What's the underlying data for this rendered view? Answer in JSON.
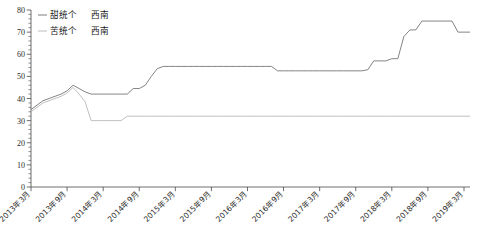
{
  "chart_data": {
    "type": "line",
    "title": "",
    "subtitle": "",
    "xlabel": "",
    "ylabel": "",
    "ylim": [
      0,
      80
    ],
    "ytick_step": 10,
    "yticks": [
      "0",
      "10",
      "20",
      "30",
      "40",
      "50",
      "60",
      "70",
      "80"
    ],
    "minor_tick_step": 2,
    "grid": false,
    "legend_position": "top-left",
    "x_tick_labels": [
      "2013年3月",
      "2013年9月",
      "2014年3月",
      "2014年9月",
      "2015年3月",
      "2015年9月",
      "2016年3月",
      "2016年9月",
      "2017年3月",
      "2017年9月",
      "2018年3月",
      "2018年9月",
      "2019年3月"
    ],
    "x_tick_months": [
      0,
      6,
      12,
      18,
      24,
      30,
      36,
      42,
      48,
      54,
      60,
      66,
      72
    ],
    "x_range_months": [
      0,
      73
    ],
    "series": [
      {
        "name": "甜统个　西南",
        "legend_label": "甜统个",
        "legend_region": "西南",
        "color": "#6e6e6e",
        "values": [
          35.0,
          37.0,
          39.0,
          40.0,
          41.0,
          42.0,
          43.5,
          46.0,
          44.5,
          43.0,
          42.0,
          42.0,
          42.0,
          42.0,
          42.0,
          42.0,
          42.0,
          44.5,
          44.5,
          46.0,
          50.0,
          53.5,
          54.5,
          54.5,
          54.5,
          54.5,
          54.5,
          54.5,
          54.5,
          54.5,
          54.5,
          54.5,
          54.5,
          54.5,
          54.5,
          54.5,
          54.5,
          54.5,
          54.5,
          54.5,
          54.5,
          52.5,
          52.5,
          52.5,
          52.5,
          52.5,
          52.5,
          52.5,
          52.5,
          52.5,
          52.5,
          52.5,
          52.5,
          52.5,
          52.5,
          52.5,
          53.0,
          57.0,
          57.0,
          57.0,
          58.0,
          58.0,
          68.0,
          71.0,
          71.0,
          75.0,
          75.0,
          75.0,
          75.0,
          75.0,
          75.0,
          70.0,
          70.0,
          70.0
        ]
      },
      {
        "name": "苦统个　西南",
        "legend_label": "苦统个",
        "legend_region": "西南",
        "color": "#b4b4b4",
        "values": [
          34.0,
          36.0,
          38.0,
          39.0,
          40.0,
          41.0,
          42.5,
          45.0,
          42.0,
          38.5,
          30.0,
          30.0,
          30.0,
          30.0,
          30.0,
          30.0,
          32.0,
          32.0,
          32.0,
          32.0,
          32.0,
          32.0,
          32.0,
          32.0,
          32.0,
          32.0,
          32.0,
          32.0,
          32.0,
          32.0,
          32.0,
          32.0,
          32.0,
          32.0,
          32.0,
          32.0,
          32.0,
          32.0,
          32.0,
          32.0,
          32.0,
          32.0,
          32.0,
          32.0,
          32.0,
          32.0,
          32.0,
          32.0,
          32.0,
          32.0,
          32.0,
          32.0,
          32.0,
          32.0,
          32.0,
          32.0,
          32.0,
          32.0,
          32.0,
          32.0,
          32.0,
          32.0,
          32.0,
          32.0,
          32.0,
          32.0,
          32.0,
          32.0,
          32.0,
          32.0,
          32.0,
          32.0,
          32.0,
          32.0
        ]
      }
    ]
  },
  "legend": {
    "entries": [
      {
        "dash": "—",
        "label": "甜统个",
        "region": "西南"
      },
      {
        "dash": "—",
        "label": "苦统个",
        "region": "西南"
      }
    ]
  }
}
